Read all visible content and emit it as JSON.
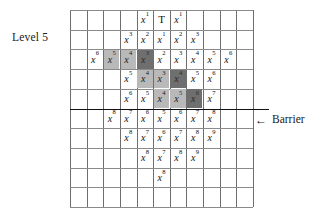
{
  "figure": {
    "level_label": "Level 5",
    "barrier_label": "Barrier",
    "barrier_arrow": "←",
    "colors": {
      "shade_light": "#b9b9b9",
      "shade_dark": "#6f6f6f",
      "grid_line": "#8a8a8a",
      "grid_line_vertical": "#6e6e6e",
      "barrier_line": "#111111",
      "text": "#1a1a1a",
      "background": "#ffffff"
    },
    "grid": {
      "columns": 11,
      "rows": 10,
      "barrier_after_row": 5
    }
  },
  "chart_data": {
    "type": "table",
    "xlabel": "",
    "ylabel": "",
    "grid": true,
    "legend": "none",
    "annotations": [
      {
        "text": "Level 5",
        "position": "left-of-row-1"
      },
      {
        "text": "← Barrier",
        "position": "right-of-barrier-line"
      }
    ],
    "cells": [
      {
        "row": 1,
        "col": 5,
        "base": "x",
        "exp": "1",
        "shade": "none"
      },
      {
        "row": 1,
        "col": 6,
        "base": "T",
        "exp": "",
        "shade": "none"
      },
      {
        "row": 1,
        "col": 7,
        "base": "x",
        "exp": "1",
        "shade": "none"
      },
      {
        "row": 2,
        "col": 4,
        "base": "x",
        "exp": "3",
        "shade": "none"
      },
      {
        "row": 2,
        "col": 5,
        "base": "x",
        "exp": "2",
        "shade": "none"
      },
      {
        "row": 2,
        "col": 6,
        "base": "x",
        "exp": "1",
        "shade": "none"
      },
      {
        "row": 2,
        "col": 7,
        "base": "x",
        "exp": "2",
        "shade": "none"
      },
      {
        "row": 2,
        "col": 8,
        "base": "x",
        "exp": "3",
        "shade": "none"
      },
      {
        "row": 3,
        "col": 2,
        "base": "x",
        "exp": "6",
        "shade": "none"
      },
      {
        "row": 3,
        "col": 3,
        "base": "x",
        "exp": "5",
        "shade": "light"
      },
      {
        "row": 3,
        "col": 4,
        "base": "x",
        "exp": "4",
        "shade": "light"
      },
      {
        "row": 3,
        "col": 5,
        "base": "x",
        "exp": "3",
        "shade": "dark"
      },
      {
        "row": 3,
        "col": 6,
        "base": "x",
        "exp": "2",
        "shade": "none"
      },
      {
        "row": 3,
        "col": 7,
        "base": "x",
        "exp": "3",
        "shade": "none"
      },
      {
        "row": 3,
        "col": 8,
        "base": "x",
        "exp": "4",
        "shade": "none"
      },
      {
        "row": 3,
        "col": 9,
        "base": "x",
        "exp": "5",
        "shade": "none"
      },
      {
        "row": 3,
        "col": 10,
        "base": "x",
        "exp": "6",
        "shade": "none"
      },
      {
        "row": 4,
        "col": 4,
        "base": "x",
        "exp": "5",
        "shade": "none"
      },
      {
        "row": 4,
        "col": 5,
        "base": "x",
        "exp": "4",
        "shade": "light"
      },
      {
        "row": 4,
        "col": 6,
        "base": "x",
        "exp": "3",
        "shade": "light"
      },
      {
        "row": 4,
        "col": 7,
        "base": "x",
        "exp": "4",
        "shade": "dark"
      },
      {
        "row": 4,
        "col": 8,
        "base": "x",
        "exp": "5",
        "shade": "none"
      },
      {
        "row": 4,
        "col": 9,
        "base": "x",
        "exp": "6",
        "shade": "none"
      },
      {
        "row": 5,
        "col": 4,
        "base": "x",
        "exp": "6",
        "shade": "none"
      },
      {
        "row": 5,
        "col": 5,
        "base": "x",
        "exp": "5",
        "shade": "none"
      },
      {
        "row": 5,
        "col": 6,
        "base": "x",
        "exp": "4",
        "shade": "light"
      },
      {
        "row": 5,
        "col": 7,
        "base": "x",
        "exp": "5",
        "shade": "light"
      },
      {
        "row": 5,
        "col": 8,
        "base": "x",
        "exp": "6",
        "shade": "dark"
      },
      {
        "row": 5,
        "col": 9,
        "base": "x",
        "exp": "7",
        "shade": "none"
      },
      {
        "row": 6,
        "col": 3,
        "base": "x",
        "exp": "8",
        "shade": "none"
      },
      {
        "row": 6,
        "col": 4,
        "base": "x",
        "exp": "7",
        "shade": "none"
      },
      {
        "row": 6,
        "col": 5,
        "base": "x",
        "exp": "6",
        "shade": "none"
      },
      {
        "row": 6,
        "col": 6,
        "base": "x",
        "exp": "5",
        "shade": "none"
      },
      {
        "row": 6,
        "col": 7,
        "base": "x",
        "exp": "6",
        "shade": "none"
      },
      {
        "row": 6,
        "col": 8,
        "base": "x",
        "exp": "7",
        "shade": "none"
      },
      {
        "row": 6,
        "col": 9,
        "base": "x",
        "exp": "8",
        "shade": "none"
      },
      {
        "row": 7,
        "col": 4,
        "base": "x",
        "exp": "8",
        "shade": "none"
      },
      {
        "row": 7,
        "col": 5,
        "base": "x",
        "exp": "7",
        "shade": "none"
      },
      {
        "row": 7,
        "col": 6,
        "base": "x",
        "exp": "6",
        "shade": "none"
      },
      {
        "row": 7,
        "col": 7,
        "base": "x",
        "exp": "7",
        "shade": "none"
      },
      {
        "row": 7,
        "col": 8,
        "base": "x",
        "exp": "8",
        "shade": "none"
      },
      {
        "row": 7,
        "col": 9,
        "base": "x",
        "exp": "9",
        "shade": "none"
      },
      {
        "row": 8,
        "col": 5,
        "base": "x",
        "exp": "8",
        "shade": "none"
      },
      {
        "row": 8,
        "col": 6,
        "base": "x",
        "exp": "7",
        "shade": "none"
      },
      {
        "row": 8,
        "col": 7,
        "base": "x",
        "exp": "8",
        "shade": "none"
      },
      {
        "row": 8,
        "col": 8,
        "base": "x",
        "exp": "9",
        "shade": "none"
      },
      {
        "row": 9,
        "col": 6,
        "base": "x",
        "exp": "8",
        "shade": "none"
      }
    ]
  }
}
